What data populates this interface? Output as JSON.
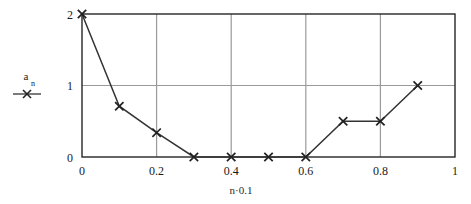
{
  "chart_data": {
    "type": "line",
    "title": "",
    "subtitle": "",
    "xlabel": "n·0.1",
    "ylabel": "a",
    "ylabel_subscript": "n",
    "legend_entries": [
      {
        "name": "a_n",
        "marker": "x-cross",
        "color": "#333333"
      }
    ],
    "legend_position": "left-outside",
    "grid": true,
    "grid_color": "#9a9a9a",
    "xlim": [
      0,
      1
    ],
    "ylim": [
      0,
      2
    ],
    "xticks": [
      0,
      0.2,
      0.4,
      0.6,
      0.8,
      1
    ],
    "xtick_labels": [
      "0",
      "0.2",
      "0.4",
      "0.6",
      "0.8",
      "1"
    ],
    "yticks": [
      0,
      1,
      2
    ],
    "ytick_labels": [
      "0",
      "1",
      "2"
    ],
    "x_gridlines": [
      0.2,
      0.4,
      0.6,
      0.8
    ],
    "y_gridlines": [
      1
    ],
    "x": [
      0,
      0.1,
      0.2,
      0.3,
      0.4,
      0.5,
      0.6,
      0.7,
      0.8,
      0.9
    ],
    "values": [
      2,
      0.71,
      0.34,
      0,
      0,
      0,
      0,
      0.5,
      0.5,
      1
    ],
    "series": [
      {
        "name": "a_n",
        "marker": "x-cross",
        "color": "#333333",
        "values": [
          2,
          0.71,
          0.34,
          0,
          0,
          0,
          0,
          0.5,
          0.5,
          1
        ]
      }
    ]
  },
  "geometry": {
    "plot_left": 82,
    "plot_right": 455,
    "plot_top": 14,
    "plot_bottom": 157
  }
}
